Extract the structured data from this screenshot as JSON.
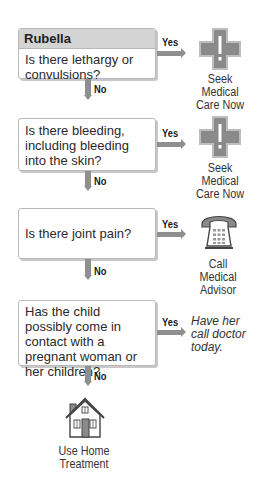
{
  "colors": {
    "header_bg": "#d4d4d4",
    "arrow": "#8f8f8f",
    "icon_fill": "#8a8a8a",
    "border": "#b9b9b9"
  },
  "flowchart": {
    "title": "Rubella",
    "steps": [
      {
        "question": "Is there lethargy or convulsions?",
        "yes_label": "Yes",
        "no_label": "No",
        "yes_outcome": {
          "icon": "medical-cross-icon",
          "text": "Seek Medical Care Now"
        }
      },
      {
        "question": "Is there bleeding, including bleeding into the skin?",
        "yes_label": "Yes",
        "no_label": "No",
        "yes_outcome": {
          "icon": "medical-cross-icon",
          "text": "Seek Medical Care Now"
        }
      },
      {
        "question": "Is there joint pain?",
        "yes_label": "Yes",
        "no_label": "No",
        "yes_outcome": {
          "icon": "telephone-icon",
          "text": "Call Medical Advisor"
        }
      },
      {
        "question": "Has the child possibly come in contact with a pregnant woman or her children?",
        "yes_label": "Yes",
        "no_label": "No",
        "yes_outcome": {
          "icon": null,
          "text": "Have her call doctor today."
        }
      }
    ],
    "final_outcome": {
      "icon": "house-icon",
      "text": "Use Home Treatment"
    }
  }
}
